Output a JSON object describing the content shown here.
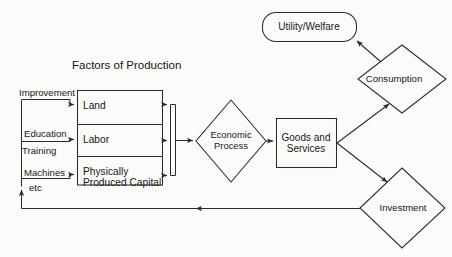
{
  "diagram": {
    "title": "Factors of Production",
    "background_color": "#fbfbf9",
    "stroke_color": "#2b2b2b",
    "text_color": "#171717",
    "inputs": [
      {
        "id": "improvement",
        "label": "Improvement"
      },
      {
        "id": "education",
        "label": "Education"
      },
      {
        "id": "training",
        "label": "Training"
      },
      {
        "id": "machines",
        "label": "Machines"
      },
      {
        "id": "etc",
        "label": "etc"
      }
    ],
    "factor_cells": [
      {
        "id": "land",
        "label": "Land"
      },
      {
        "id": "labor",
        "label": "Labor"
      },
      {
        "id": "capital",
        "label": "Physically\nProduced Capital"
      }
    ],
    "nodes": [
      {
        "id": "economic-process",
        "label": "Economic\nProcess",
        "shape": "diamond"
      },
      {
        "id": "goods-services",
        "label": "Goods and\nServices",
        "shape": "rectangle"
      },
      {
        "id": "utility-welfare",
        "label": "Utility/Welfare",
        "shape": "rounded-rectangle"
      },
      {
        "id": "consumption",
        "label": "Consumption",
        "shape": "diamond"
      },
      {
        "id": "investment",
        "label": "Investment",
        "shape": "diamond"
      }
    ]
  }
}
